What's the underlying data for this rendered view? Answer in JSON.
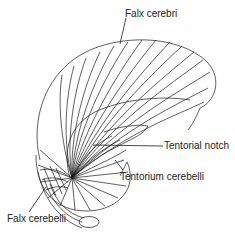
{
  "diagram": {
    "labels": {
      "falx_cerebri": "Falx cerebri",
      "tentorial_notch": "Tentorial notch",
      "tentorium_cerebelli": "Tentorium cerebelli",
      "falx_cerebelli": "Falx cerebelli"
    },
    "colors": {
      "line": "#1a1a1a",
      "text": "#222222",
      "background": "#ffffff"
    }
  }
}
